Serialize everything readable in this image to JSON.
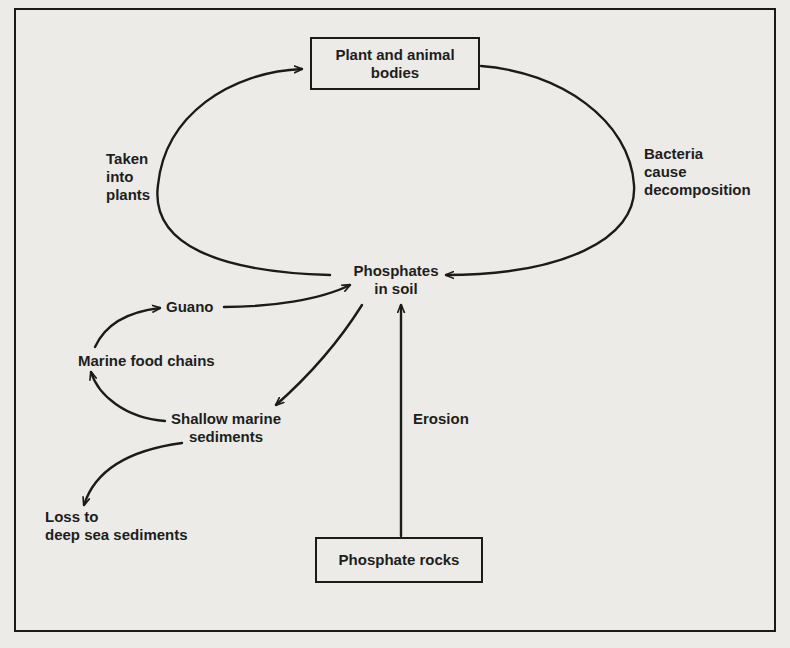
{
  "diagram": {
    "type": "cycle",
    "topic": "Phosphorus cycle",
    "nodes": {
      "plant_animal_bodies": "Plant and animal\nbodies",
      "phosphates_in_soil": "Phosphates\nin soil",
      "guano": "Guano",
      "marine_food_chains": "Marine food chains",
      "shallow_marine_sediments": "Shallow marine\nsediments",
      "loss_deep_sea": "Loss to\ndeep sea sediments",
      "phosphate_rocks": "Phosphate rocks"
    },
    "edge_labels": {
      "taken_into_plants": "Taken\ninto\nplants",
      "bacteria_decomposition": "Bacteria\ncause\ndecomposition",
      "erosion": "Erosion"
    },
    "edges": [
      {
        "from": "Phosphates in soil",
        "to": "Plant and animal bodies",
        "label": "Taken into plants"
      },
      {
        "from": "Plant and animal bodies",
        "to": "Phosphates in soil",
        "label": "Bacteria cause decomposition"
      },
      {
        "from": "Phosphates in soil",
        "to": "Shallow marine sediments",
        "label": ""
      },
      {
        "from": "Shallow marine sediments",
        "to": "Marine food chains",
        "label": ""
      },
      {
        "from": "Marine food chains",
        "to": "Guano",
        "label": ""
      },
      {
        "from": "Guano",
        "to": "Phosphates in soil",
        "label": ""
      },
      {
        "from": "Shallow marine sediments",
        "to": "Loss to deep sea sediments",
        "label": ""
      },
      {
        "from": "Phosphate rocks",
        "to": "Phosphates in soil",
        "label": "Erosion"
      }
    ],
    "colors": {
      "ink": "#1b1b1b",
      "paper": "#ecebe7"
    }
  }
}
